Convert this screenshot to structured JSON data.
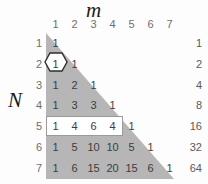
{
  "axes": {
    "x_title": "m",
    "y_title": "N"
  },
  "chart_data": {
    "type": "table",
    "xlabel": "m",
    "ylabel": "N",
    "grid": false,
    "legend": "none",
    "column_headers": [
      "1",
      "2",
      "3",
      "4",
      "5",
      "6",
      "7"
    ],
    "row_headers": [
      "1",
      "2",
      "3",
      "4",
      "5",
      "6",
      "7"
    ],
    "rows": [
      [
        "1"
      ],
      [
        "1",
        "1"
      ],
      [
        "1",
        "2",
        "1"
      ],
      [
        "1",
        "3",
        "3",
        "1"
      ],
      [
        "1",
        "4",
        "6",
        "4",
        "1"
      ],
      [
        "1",
        "5",
        "10",
        "10",
        "5",
        "1"
      ],
      [
        "1",
        "6",
        "15",
        "20",
        "15",
        "6",
        "1"
      ]
    ],
    "row_sums": [
      "1",
      "2",
      "4",
      "8",
      "16",
      "32",
      "64"
    ],
    "annotations": {
      "hexagon_cell": {
        "row": 2,
        "col": 1,
        "value": "1"
      },
      "highlight_row": {
        "row": 5,
        "col_start": 1,
        "col_end": 4,
        "values": [
          "1",
          "4",
          "6",
          "4"
        ]
      }
    }
  },
  "colors": {
    "triangle_fill": "#b6b6b6",
    "background": "#fdfdfd",
    "highlight_fill": "#ffffff",
    "highlight_border": "#9a9a9a",
    "cell_text": "#3d3d3d",
    "header_text": "#6e6e6e",
    "sum_text": "#5a5a5a",
    "title_text": "#1a1a1a"
  }
}
